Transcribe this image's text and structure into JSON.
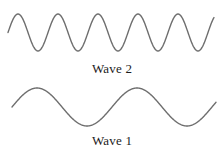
{
  "figure": {
    "background_color": "#ffffff",
    "stroke_color": "#6e6e6e",
    "label_color": "#1c1c1c",
    "width": 224,
    "height": 157
  },
  "waves": [
    {
      "id": "wave-2",
      "label": "Wave 2",
      "label_y": 68,
      "cycles": 5,
      "wavelength": 40,
      "amplitude": 18.5,
      "baseline_y": 32.5,
      "peak_y": 14,
      "trough_y": 51,
      "x_start": 8,
      "x_end": 214,
      "stroke_width": 1.4,
      "phase": "starts-rising"
    },
    {
      "id": "wave-1",
      "label": "Wave 1",
      "label_y": 140,
      "cycles": 2,
      "wavelength": 100,
      "amplitude": 19,
      "baseline_y": 107,
      "peak_y": 88,
      "trough_y": 126,
      "x_start": 12,
      "x_end": 216,
      "stroke_width": 1.4,
      "phase": "starts-rising"
    }
  ],
  "chart_data": {
    "type": "line",
    "title": "",
    "xlabel": "",
    "ylabel": "",
    "grid": false,
    "legend_position": "below-each-curve",
    "series": [
      {
        "name": "Wave 2",
        "description": "High-frequency sine wave with five complete crests across the frame",
        "cycles": 5,
        "wavelength_px": 40,
        "amplitude_px": 18.5,
        "relative_frequency": 5,
        "relative_amplitude": 1.0
      },
      {
        "name": "Wave 1",
        "description": "Low-frequency sine wave with two crests across the frame",
        "cycles": 2,
        "wavelength_px": 100,
        "amplitude_px": 19,
        "relative_frequency": 2,
        "relative_amplitude": 1.0
      }
    ]
  }
}
